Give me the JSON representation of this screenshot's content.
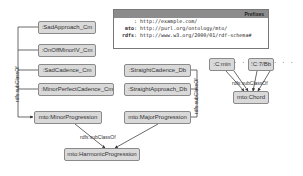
{
  "prefixes": {
    "title": "Prefixes",
    "rows": [
      {
        "key": "",
        "value": ": http://example.com/"
      },
      {
        "key": "mto",
        "value": ": http://purl.org/ontology/mto/"
      },
      {
        "key": "rdfs",
        "value": ": http://www.w3.org/2000/01/rdf-schema#"
      }
    ]
  },
  "nodes": {
    "sad_approach": ":SadApproach_Cm",
    "onoff_minor": ":OnOffMinorIV_Cm",
    "sad_cadence": ":SadCadence_Cm",
    "minor_perfect": ":MinorPerfectCadence_Cm",
    "minor_prog": "mto:MinorProgression",
    "straight_cadence": ":StraightCadence_Db",
    "straight_approach": ":StraightApproach_Db",
    "major_prog": "mto:MajorProgression",
    "harmonic_prog": "mto:HarmonicProgression",
    "cmin": ":C:min",
    "c7bb": ":C:7/Bb",
    "chord": "mto:Chord"
  },
  "edge_labels": {
    "left": "rdfs:subClassOf",
    "middle": "rdfs:subClassOf",
    "bottom": "rdfs:subClassOf",
    "chord": "rdfs:subClassOf"
  },
  "ellipsis": "· · ·"
}
